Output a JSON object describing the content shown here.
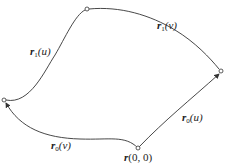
{
  "diagram": {
    "type": "parametric surface patch boundary curves",
    "labels": {
      "r1u": {
        "base": "r",
        "sub": "1",
        "arg": "(u)"
      },
      "r1v": {
        "base": "r",
        "sub": "1",
        "arg": "(v)"
      },
      "r0u": {
        "base": "r",
        "sub": "0",
        "arg": "(u)"
      },
      "r0v": {
        "base": "r",
        "sub": "0",
        "arg": "(v)"
      },
      "origin": {
        "base": "r",
        "arg": "(0, 0)"
      }
    },
    "points": {
      "origin": [
        138,
        149
      ],
      "left": [
        4,
        100
      ],
      "top": [
        87,
        9
      ],
      "right": [
        221,
        71
      ]
    },
    "stroke_color": "#333333"
  }
}
